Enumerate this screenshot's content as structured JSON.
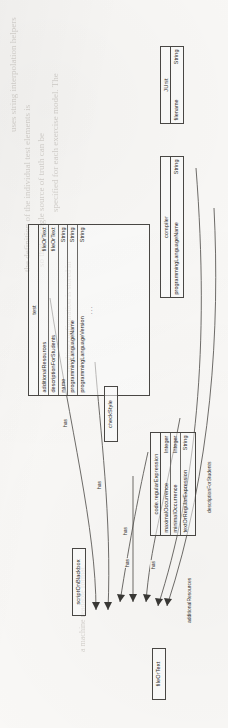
{
  "page": {
    "background_color": "#fbfaf8",
    "ink_color": "#2b2a28",
    "ghost_lines": [
      "uses string interpolation helpers",
      "the definition of the individual test elements is",
      "so that a single source of truth can be",
      "specified for each exercise model. The",
      "resulting configuration is stored in",
      "a machine readable format."
    ]
  },
  "diagram": {
    "type": "uml-class-diagram",
    "orientation_degrees": -90,
    "relation_label": "has",
    "classes": [
      {
        "id": "test",
        "title": "test",
        "attributes": [
          {
            "name": "additionalResources",
            "type": "fileOrText"
          },
          {
            "name": "descriptionForStudents",
            "type": "fileOrText"
          },
          {
            "name": "name",
            "type": "String"
          },
          {
            "name": "programmingLanguageName",
            "type": "String"
          },
          {
            "name": "programmingLanguageVersion",
            "type": "String"
          }
        ],
        "ellipsis": "..."
      },
      {
        "id": "compiler",
        "title": "compiler",
        "attributes": [
          {
            "name": "programmingLanguageName",
            "type": "String"
          }
        ]
      },
      {
        "id": "junit",
        "title": "JUnit",
        "attributes": [
          {
            "name": "filename",
            "type": "String"
          }
        ]
      },
      {
        "id": "checkstyle",
        "title": "checkStyle",
        "attributes": []
      },
      {
        "id": "code-regular-expression",
        "title": "code.regularExpression",
        "attributes": [
          {
            "name": "maximalOccurrence",
            "type": "Integer"
          },
          {
            "name": "minimalOccurrence",
            "type": "Integer"
          },
          {
            "name": "textOrRegularExpression",
            "type": "String"
          }
        ]
      },
      {
        "id": "script-on-blackbox",
        "title": "scriptOnBlackbox",
        "attributes": []
      },
      {
        "id": "file-or-text",
        "title": "fileOrText",
        "attributes": []
      }
    ],
    "edges": [
      {
        "from": "junit",
        "to": "test",
        "label": "has"
      },
      {
        "from": "compiler",
        "to": "test",
        "label": "has"
      },
      {
        "from": "checkstyle",
        "to": "test",
        "label": "has"
      },
      {
        "from": "code-regular-expression",
        "to": "test",
        "label": "has"
      },
      {
        "from": "script-on-blackbox",
        "to": "test",
        "label": "has"
      },
      {
        "from": "file-or-text",
        "to": "test",
        "label": "additionalResources"
      },
      {
        "from": "file-or-text",
        "to": "test",
        "label": "descriptionForStudents"
      }
    ]
  }
}
